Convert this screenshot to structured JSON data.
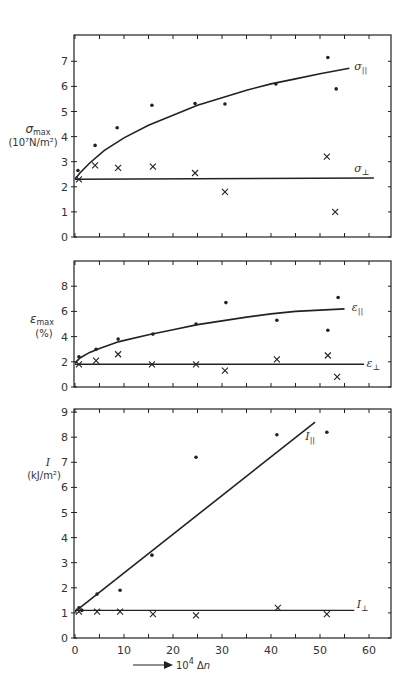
{
  "figure": {
    "background": "#ffffff",
    "ink": "#222222"
  },
  "chart_data": [
    {
      "id": "sigma",
      "type": "scatter",
      "ylabel": "σmax",
      "ylabel_units": "(10⁷N/m²)",
      "xlim": [
        0,
        64
      ],
      "ylim": [
        0,
        8
      ],
      "yticks": [
        0,
        1,
        2,
        3,
        4,
        5,
        6,
        7
      ],
      "xticks_minor_step": 5,
      "grid": false,
      "frame_px": {
        "left": 74,
        "right": 391,
        "top": 35,
        "bottom": 237
      },
      "series": [
        {
          "name": "σ∥",
          "label": "σ∥",
          "marker": "dot",
          "x": [
            0.6,
            4.1,
            8.6,
            15.7,
            24.5,
            30.6,
            41.0,
            51.6,
            53.3
          ],
          "y": [
            2.65,
            3.65,
            4.35,
            5.25,
            5.32,
            5.3,
            6.1,
            7.15,
            5.9
          ]
        },
        {
          "name": "σ⊥",
          "label": "σ⊥",
          "marker": "cross",
          "x": [
            0.8,
            4.1,
            8.8,
            15.9,
            24.5,
            30.6,
            51.4,
            53.1
          ],
          "y": [
            2.3,
            2.85,
            2.75,
            2.8,
            2.55,
            1.8,
            3.2,
            1.0
          ]
        }
      ],
      "fits": [
        {
          "name": "σ∥ fit",
          "kind": "curve",
          "x": [
            0,
            1,
            3,
            6,
            10,
            15,
            20,
            25,
            30,
            35,
            40,
            45,
            50,
            56
          ],
          "y": [
            2.3,
            2.55,
            2.95,
            3.45,
            3.95,
            4.45,
            4.85,
            5.25,
            5.55,
            5.85,
            6.1,
            6.3,
            6.5,
            6.72
          ],
          "label_at": [
            57,
            6.65
          ]
        },
        {
          "name": "σ⊥ fit",
          "kind": "line",
          "x": [
            0,
            61
          ],
          "y": [
            2.3,
            2.35
          ],
          "label_at": [
            57,
            2.6
          ]
        }
      ]
    },
    {
      "id": "epsilon",
      "type": "scatter",
      "ylabel": "εmax",
      "ylabel_units": "(%)",
      "xlim": [
        0,
        64
      ],
      "ylim": [
        0,
        10
      ],
      "yticks": [
        0,
        2,
        4,
        6,
        8
      ],
      "grid": false,
      "frame_px": {
        "left": 74,
        "right": 391,
        "top": 261,
        "bottom": 387
      },
      "series": [
        {
          "name": "ε∥",
          "label": "ε∥",
          "marker": "dot",
          "x": [
            0.8,
            4.3,
            8.8,
            15.9,
            24.7,
            30.8,
            41.2,
            51.6,
            53.7
          ],
          "y": [
            2.4,
            3.0,
            3.8,
            4.2,
            5.0,
            6.7,
            5.3,
            4.5,
            7.1
          ]
        },
        {
          "name": "ε⊥",
          "label": "ε⊥",
          "marker": "cross",
          "x": [
            0.8,
            4.3,
            8.8,
            15.7,
            24.7,
            30.6,
            41.2,
            51.6,
            53.5
          ],
          "y": [
            1.8,
            2.1,
            2.6,
            1.8,
            1.8,
            1.3,
            2.2,
            2.5,
            0.8
          ]
        }
      ],
      "fits": [
        {
          "name": "ε∥ fit",
          "kind": "curve",
          "x": [
            0,
            1,
            3,
            5,
            9,
            15,
            20,
            25,
            30,
            35,
            40,
            45,
            50,
            55
          ],
          "y": [
            1.9,
            2.3,
            2.75,
            3.05,
            3.6,
            4.15,
            4.55,
            4.95,
            5.25,
            5.55,
            5.8,
            6.0,
            6.1,
            6.2
          ],
          "label_at": [
            56.5,
            6.0
          ]
        },
        {
          "name": "ε⊥ fit",
          "kind": "line",
          "x": [
            0,
            59
          ],
          "y": [
            1.8,
            1.8
          ],
          "label_at": [
            59.5,
            1.6
          ]
        }
      ]
    },
    {
      "id": "impact",
      "type": "scatter",
      "ylabel": "I",
      "ylabel_units": "(kJ/m²)",
      "xlabel": "10⁴ Δn",
      "xlim": [
        0,
        64
      ],
      "ylim": [
        0,
        9
      ],
      "yticks": [
        0,
        1,
        2,
        3,
        4,
        5,
        6,
        7,
        8,
        9
      ],
      "xticks": [
        0,
        10,
        20,
        30,
        40,
        50,
        60
      ],
      "grid": false,
      "frame_px": {
        "left": 74,
        "right": 391,
        "top": 409,
        "bottom": 638
      },
      "series": [
        {
          "name": "I∥",
          "label": "I∥",
          "marker": "dot",
          "x": [
            0.8,
            1.4,
            4.5,
            9.2,
            15.7,
            24.7,
            41.2,
            51.4
          ],
          "y": [
            1.2,
            1.1,
            1.75,
            1.9,
            3.3,
            7.2,
            8.1,
            8.2
          ]
        },
        {
          "name": "I⊥",
          "label": "I⊥",
          "marker": "cross",
          "x": [
            0.8,
            4.5,
            9.2,
            15.9,
            24.7,
            41.4,
            51.4
          ],
          "y": [
            1.05,
            1.05,
            1.05,
            0.95,
            0.9,
            1.2,
            0.95
          ]
        }
      ],
      "fits": [
        {
          "name": "I∥ fit",
          "kind": "line",
          "x": [
            0,
            49
          ],
          "y": [
            1.05,
            8.6
          ],
          "label_at": [
            47,
            7.9
          ]
        },
        {
          "name": "I⊥ fit",
          "kind": "line",
          "x": [
            0,
            57
          ],
          "y": [
            1.1,
            1.1
          ],
          "label_at": [
            57.5,
            1.2
          ]
        }
      ]
    }
  ],
  "labels": {
    "x_axis_title": "10⁴ Δn",
    "x_tick_labels": [
      "0",
      "10",
      "20",
      "30",
      "40",
      "50",
      "60"
    ]
  }
}
